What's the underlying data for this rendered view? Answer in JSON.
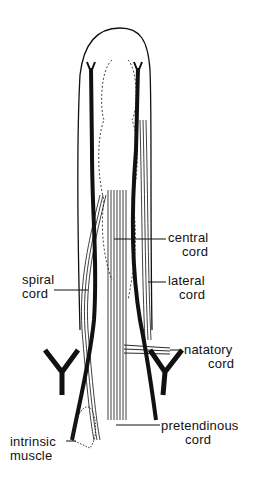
{
  "figure": {
    "labels": {
      "central": {
        "line1": "central",
        "line2": "cord"
      },
      "lateral": {
        "line1": "lateral",
        "line2": "cord"
      },
      "spiral": {
        "line1": "spiral",
        "line2": "cord"
      },
      "natatory": {
        "line1": "natatory",
        "line2": "cord"
      },
      "pretendinous": {
        "line1": "pretendinous",
        "line2": "cord"
      },
      "intrinsic": {
        "line1": "intrinsic",
        "line2": "muscle"
      }
    },
    "colors": {
      "ink": "#111111",
      "background": "#ffffff"
    }
  }
}
